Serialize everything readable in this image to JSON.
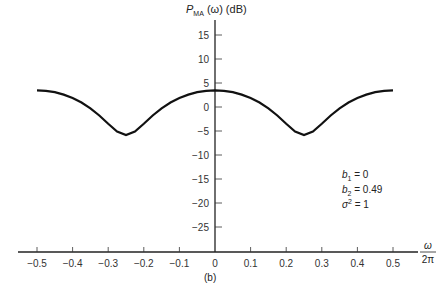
{
  "chart_data": {
    "type": "line",
    "ylabel": "P_MA (ω) (dB)",
    "xlabel": "ω/2π",
    "caption": "(b)",
    "xlim": [
      -0.5,
      0.5
    ],
    "ylim": [
      -30,
      18
    ],
    "xticks": [
      -0.5,
      -0.4,
      -0.3,
      -0.2,
      -0.1,
      0,
      0.1,
      0.2,
      0.3,
      0.4,
      0.5
    ],
    "yticks": [
      15,
      10,
      5,
      0,
      -5,
      -10,
      -15,
      -20,
      -25
    ],
    "grid": false,
    "annotations": [
      "b1 = 0",
      "b2 = 0.49",
      "σ² = 1"
    ],
    "series": [
      {
        "name": "P_MA",
        "x": [
          -0.5,
          -0.475,
          -0.45,
          -0.425,
          -0.4,
          -0.375,
          -0.35,
          -0.325,
          -0.3,
          -0.275,
          -0.25,
          -0.225,
          -0.2,
          -0.175,
          -0.15,
          -0.125,
          -0.1,
          -0.075,
          -0.05,
          -0.025,
          0,
          0.025,
          0.05,
          0.075,
          0.1,
          0.125,
          0.15,
          0.175,
          0.2,
          0.225,
          0.25,
          0.275,
          0.3,
          0.325,
          0.35,
          0.375,
          0.4,
          0.425,
          0.45,
          0.475,
          0.5
        ],
        "values": [
          3.46,
          3.37,
          3.08,
          2.59,
          1.88,
          0.93,
          -0.28,
          -1.78,
          -3.49,
          -5.11,
          -5.85,
          -5.11,
          -3.49,
          -1.78,
          -0.28,
          0.93,
          1.88,
          2.59,
          3.08,
          3.37,
          3.46,
          3.37,
          3.08,
          2.59,
          1.88,
          0.93,
          -0.28,
          -1.78,
          -3.49,
          -5.11,
          -5.85,
          -5.11,
          -3.49,
          -1.78,
          -0.28,
          0.93,
          1.88,
          2.59,
          3.08,
          3.37,
          3.46
        ]
      }
    ]
  },
  "labels": {
    "title_main": "P",
    "title_sub": "MA",
    "title_rest": " (ω) (dB)",
    "xlabel_num": "ω",
    "xlabel_den": "2π",
    "caption": "(b)",
    "ann1_var": "b",
    "ann1_sub": "1",
    "ann1_val": " = 0",
    "ann2_var": "b",
    "ann2_sub": "2",
    "ann2_val": " = 0.49",
    "ann3_var": "σ",
    "ann3_sup": "2",
    "ann3_val": " = 1"
  }
}
